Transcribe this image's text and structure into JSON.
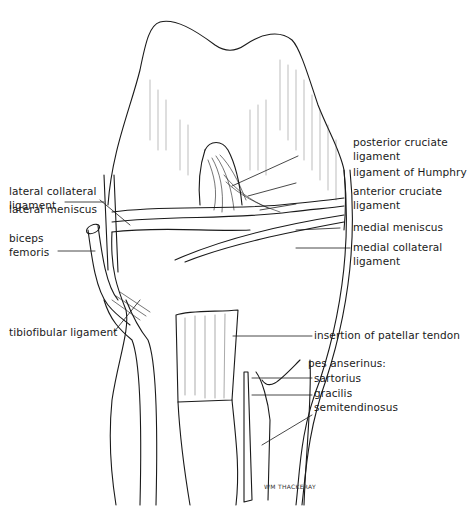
{
  "figure": {
    "signature": "WM THACKERAY",
    "ink_color": "#1a1a1a",
    "background": "#ffffff"
  },
  "labels": {
    "left": [
      {
        "id": "lateral-collateral-ligament",
        "line1": "lateral collateral",
        "line2": "ligament"
      },
      {
        "id": "lateral-meniscus",
        "line1": "lateral meniscus"
      },
      {
        "id": "biceps-femoris",
        "line1": "biceps",
        "line2": "femoris"
      },
      {
        "id": "tibiofibular-ligament",
        "line1": "tibiofibular ligament"
      }
    ],
    "right": [
      {
        "id": "posterior-cruciate-ligament",
        "line1": "posterior cruciate",
        "line2": "ligament"
      },
      {
        "id": "ligament-of-humphry",
        "line1": "ligament of Humphry"
      },
      {
        "id": "anterior-cruciate-ligament",
        "line1": "anterior cruciate",
        "line2": "ligament"
      },
      {
        "id": "medial-meniscus",
        "line1": "medial meniscus"
      },
      {
        "id": "medial-collateral-ligament",
        "line1": "medial collateral",
        "line2": "ligament"
      },
      {
        "id": "insertion-of-patellar-tendon",
        "line1": "insertion of patellar tendon"
      }
    ],
    "pes_anserinus": {
      "heading": "pes anserinus:",
      "items": [
        "sartorius",
        "gracilis",
        "semitendinosus"
      ]
    }
  }
}
